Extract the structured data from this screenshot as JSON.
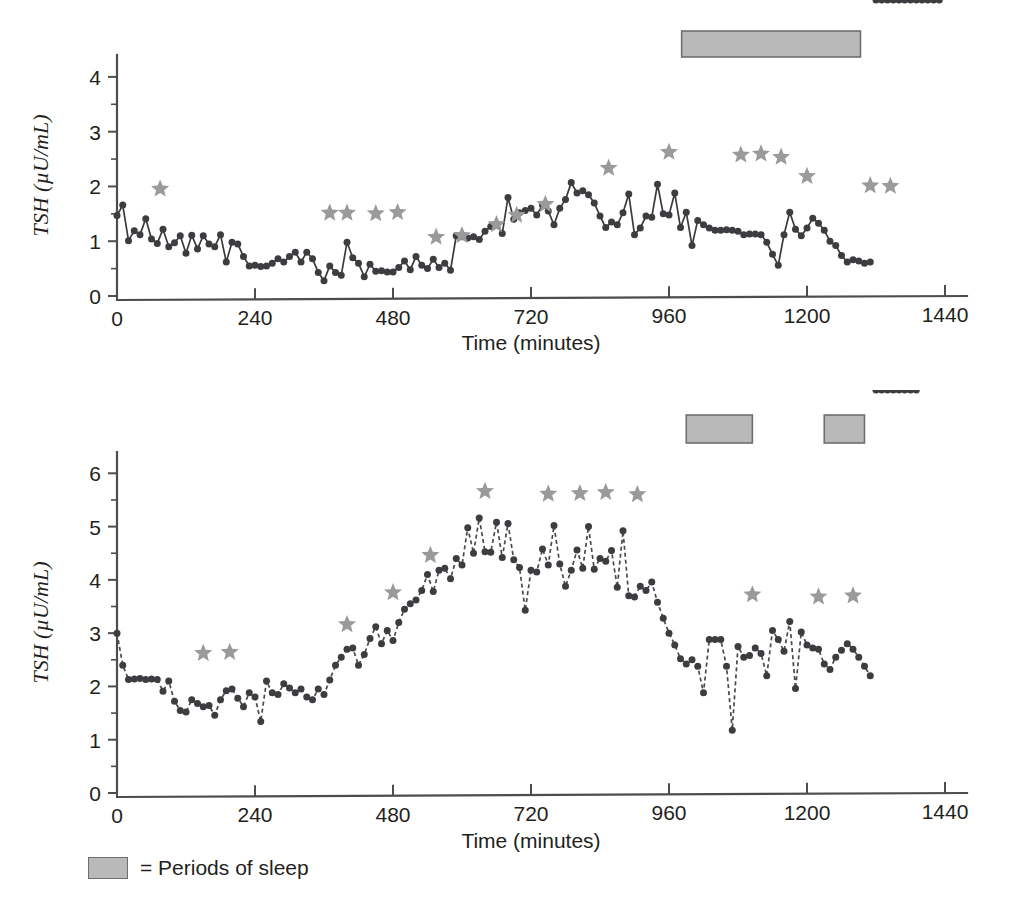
{
  "figure": {
    "legend_label": "= Periods of sleep",
    "sleep_color": "#b9b9b9",
    "star_color": "#9a9a9a",
    "marker_color": "#3d3d41"
  },
  "chart_data": [
    {
      "type": "line",
      "panel": "top",
      "title": "",
      "xlabel": "Time (minutes)",
      "ylabel": "TSH (µU/mL)",
      "xlim": [
        0,
        1440
      ],
      "ylim": [
        0,
        4.4
      ],
      "xticks": [
        0,
        240,
        480,
        720,
        960,
        1200,
        1440
      ],
      "yticks": [
        0,
        1,
        2,
        3,
        4
      ],
      "xtick_labels": [
        "0",
        "240",
        "480",
        "720",
        "960",
        "1200",
        "1440"
      ],
      "ytick_labels": [
        "0",
        "1",
        "2",
        "3",
        "4"
      ],
      "minor_yticks": [
        0.5,
        1.5,
        2.5,
        3.5
      ],
      "grid": false,
      "linestyle": "solid",
      "x": [
        0,
        10,
        20,
        30,
        40,
        50,
        60,
        70,
        80,
        90,
        100,
        110,
        120,
        130,
        140,
        150,
        160,
        170,
        180,
        190,
        200,
        210,
        220,
        230,
        240,
        250,
        260,
        270,
        280,
        290,
        300,
        310,
        320,
        330,
        340,
        350,
        360,
        370,
        380,
        390,
        400,
        410,
        420,
        430,
        440,
        450,
        460,
        470,
        480,
        490,
        500,
        510,
        520,
        530,
        540,
        550,
        560,
        570,
        580,
        590,
        600,
        610,
        620,
        630,
        640,
        650,
        660,
        670,
        680,
        690,
        700,
        710,
        720,
        730,
        740,
        750,
        760,
        770,
        780,
        790,
        800,
        810,
        820,
        830,
        840,
        850,
        860,
        870,
        880,
        890,
        900,
        910,
        920,
        930,
        940,
        950,
        960,
        970,
        980,
        990,
        1000,
        1010,
        1020,
        1030,
        1040,
        1050,
        1060,
        1070,
        1080,
        1090,
        1100,
        1110,
        1120,
        1130,
        1140,
        1150,
        1160,
        1170,
        1180,
        1190,
        1200,
        1210,
        1220,
        1230,
        1240,
        1250,
        1260,
        1270,
        1280,
        1290,
        1300,
        1310,
        1320,
        1330,
        1340,
        1350,
        1360,
        1370,
        1380,
        1390,
        1400,
        1410,
        1420,
        1430
      ],
      "y": [
        1.47,
        1.66,
        1.01,
        1.19,
        1.12,
        1.41,
        1.04,
        0.96,
        1.22,
        0.9,
        0.97,
        1.1,
        0.78,
        1.11,
        0.86,
        1.1,
        0.95,
        0.9,
        1.12,
        0.62,
        0.98,
        0.95,
        0.72,
        0.55,
        0.56,
        0.54,
        0.55,
        0.6,
        0.68,
        0.62,
        0.72,
        0.8,
        0.62,
        0.8,
        0.68,
        0.43,
        0.28,
        0.55,
        0.43,
        0.38,
        0.98,
        0.7,
        0.6,
        0.35,
        0.58,
        0.45,
        0.46,
        0.44,
        0.44,
        0.52,
        0.64,
        0.48,
        0.72,
        0.56,
        0.5,
        0.67,
        0.52,
        0.6,
        0.47,
        1.1,
        1.08,
        1.06,
        1.08,
        1.03,
        1.18,
        1.27,
        1.32,
        1.14,
        1.8,
        1.4,
        1.52,
        1.56,
        1.6,
        1.48,
        1.66,
        1.55,
        1.3,
        1.6,
        1.76,
        2.07,
        1.88,
        1.92,
        1.85,
        1.7,
        1.46,
        1.25,
        1.35,
        1.3,
        1.52,
        1.86,
        1.12,
        1.24,
        1.46,
        1.44,
        2.04,
        1.5,
        1.48,
        1.88,
        1.25,
        1.53,
        0.92,
        1.38,
        1.3,
        1.24,
        1.2,
        1.2,
        1.21,
        1.2,
        1.18,
        1.12,
        1.13,
        1.13,
        1.12,
        0.98,
        0.76,
        0.56,
        1.12,
        1.53,
        1.22,
        1.1,
        1.24,
        1.42,
        1.33,
        1.2,
        1.0,
        0.92,
        0.74,
        0.62,
        0.66,
        0.64,
        0.6,
        0.62
      ],
      "stars": [
        {
          "x": 75,
          "y": 1.7
        },
        {
          "x": 370,
          "y": 1.26
        },
        {
          "x": 400,
          "y": 1.26
        },
        {
          "x": 450,
          "y": 1.25
        },
        {
          "x": 488,
          "y": 1.27
        },
        {
          "x": 555,
          "y": 0.82
        },
        {
          "x": 600,
          "y": 0.85
        },
        {
          "x": 660,
          "y": 1.05
        },
        {
          "x": 695,
          "y": 1.22
        },
        {
          "x": 745,
          "y": 1.42
        },
        {
          "x": 855,
          "y": 2.08
        },
        {
          "x": 960,
          "y": 2.37
        },
        {
          "x": 1085,
          "y": 2.32
        },
        {
          "x": 1120,
          "y": 2.34
        },
        {
          "x": 1155,
          "y": 2.28
        },
        {
          "x": 1200,
          "y": 1.93
        },
        {
          "x": 1310,
          "y": 1.76
        },
        {
          "x": 1345,
          "y": 1.75
        }
      ],
      "sleep_periods": [
        {
          "start": 982,
          "end": 1293
        }
      ]
    },
    {
      "type": "line",
      "panel": "bottom",
      "title": "",
      "xlabel": "Time (minutes)",
      "ylabel": "TSH (µU/mL)",
      "xlim": [
        0,
        1440
      ],
      "ylim": [
        0,
        6.4
      ],
      "xticks": [
        0,
        240,
        480,
        720,
        960,
        1200,
        1440
      ],
      "yticks": [
        0,
        1,
        2,
        3,
        4,
        5,
        6
      ],
      "xtick_labels": [
        "0",
        "240",
        "480",
        "720",
        "960",
        "1200",
        "1440"
      ],
      "ytick_labels": [
        "0",
        "1",
        "2",
        "3",
        "4",
        "5",
        "6"
      ],
      "minor_yticks": [
        0.5,
        1.5,
        2.5,
        3.5,
        4.5,
        5.5
      ],
      "grid": false,
      "linestyle": "dashed",
      "x": [
        0,
        10,
        20,
        30,
        40,
        50,
        60,
        70,
        80,
        90,
        100,
        110,
        120,
        130,
        140,
        150,
        160,
        170,
        180,
        190,
        200,
        210,
        220,
        230,
        240,
        250,
        260,
        270,
        280,
        290,
        300,
        310,
        320,
        330,
        340,
        350,
        360,
        370,
        380,
        390,
        400,
        410,
        420,
        430,
        440,
        450,
        460,
        470,
        480,
        490,
        500,
        510,
        520,
        530,
        540,
        550,
        560,
        570,
        580,
        590,
        600,
        610,
        620,
        630,
        640,
        650,
        660,
        670,
        680,
        690,
        700,
        710,
        720,
        730,
        740,
        750,
        760,
        770,
        780,
        790,
        800,
        810,
        820,
        830,
        840,
        850,
        860,
        870,
        880,
        890,
        900,
        910,
        920,
        930,
        940,
        950,
        960,
        970,
        980,
        990,
        1000,
        1010,
        1020,
        1030,
        1040,
        1050,
        1060,
        1070,
        1080,
        1090,
        1100,
        1110,
        1120,
        1130,
        1140,
        1150,
        1160,
        1170,
        1180,
        1190,
        1200,
        1210,
        1220,
        1230,
        1240,
        1250,
        1260,
        1270,
        1280,
        1290,
        1300,
        1310,
        1320,
        1330,
        1340,
        1350,
        1360,
        1370,
        1380,
        1390
      ],
      "y": [
        3.0,
        2.4,
        2.13,
        2.14,
        2.15,
        2.13,
        2.14,
        2.13,
        1.91,
        2.1,
        1.72,
        1.55,
        1.52,
        1.75,
        1.68,
        1.62,
        1.64,
        1.46,
        1.75,
        1.92,
        1.95,
        1.78,
        1.62,
        1.88,
        1.8,
        1.34,
        2.1,
        1.88,
        1.85,
        2.05,
        1.97,
        1.88,
        1.95,
        1.8,
        1.75,
        1.95,
        1.85,
        2.12,
        2.4,
        2.55,
        2.7,
        2.72,
        2.4,
        2.6,
        2.9,
        3.12,
        2.8,
        3.05,
        2.86,
        3.2,
        3.45,
        3.55,
        3.62,
        3.8,
        4.1,
        3.78,
        4.18,
        4.22,
        4.02,
        4.4,
        4.28,
        4.98,
        4.5,
        5.16,
        4.53,
        4.52,
        5.08,
        4.42,
        5.06,
        4.38,
        4.23,
        3.43,
        4.18,
        4.15,
        4.58,
        4.28,
        5.02,
        4.3,
        3.88,
        4.18,
        4.56,
        4.22,
        5.0,
        4.2,
        4.4,
        4.35,
        4.55,
        3.86,
        4.92,
        3.7,
        3.68,
        3.88,
        3.8,
        3.96,
        3.58,
        3.28,
        3.0,
        2.78,
        2.52,
        2.42,
        2.5,
        2.38,
        1.88,
        2.88,
        2.88,
        2.88,
        2.38,
        1.18,
        2.75,
        2.55,
        2.58,
        2.72,
        2.62,
        2.2,
        3.05,
        2.88,
        2.66,
        3.22,
        1.96,
        3.02,
        2.78,
        2.72,
        2.7,
        2.42,
        2.32,
        2.55,
        2.68,
        2.8,
        2.7,
        2.55,
        2.38,
        2.2
      ],
      "stars": [
        {
          "x": 150,
          "y": 2.36
        },
        {
          "x": 196,
          "y": 2.38
        },
        {
          "x": 400,
          "y": 2.9
        },
        {
          "x": 480,
          "y": 3.5
        },
        {
          "x": 545,
          "y": 4.2
        },
        {
          "x": 640,
          "y": 5.4
        },
        {
          "x": 750,
          "y": 5.35
        },
        {
          "x": 805,
          "y": 5.36
        },
        {
          "x": 850,
          "y": 5.38
        },
        {
          "x": 905,
          "y": 5.34
        },
        {
          "x": 1105,
          "y": 3.46
        },
        {
          "x": 1220,
          "y": 3.42
        },
        {
          "x": 1280,
          "y": 3.44
        }
      ],
      "sleep_periods": [
        {
          "start": 990,
          "end": 1105
        },
        {
          "start": 1230,
          "end": 1300
        }
      ]
    }
  ]
}
